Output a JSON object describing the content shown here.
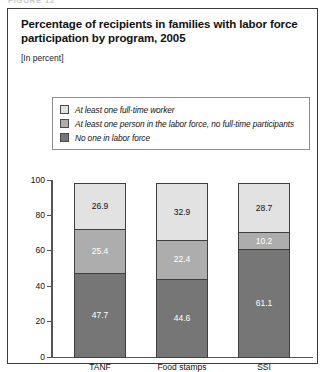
{
  "figure": {
    "caption": "FIGURE 12"
  },
  "header": {
    "title": "Percentage of recipients in families with labor force participation by program, 2005",
    "units_note": "[In percent]"
  },
  "legend": {
    "items": [
      {
        "label": "At least one full-time worker",
        "color": "#e2e2e2",
        "key": "full_time"
      },
      {
        "label": "At least one person in the labor force, no full-time participants",
        "color": "#adadad",
        "key": "partial"
      },
      {
        "label": "No one in labor force",
        "color": "#767676",
        "key": "none"
      }
    ]
  },
  "chart_data": {
    "type": "bar",
    "subtype": "stacked-column",
    "title": "Percentage of recipients in families with labor force participation by program, 2005",
    "subtitle": "[In percent]",
    "xlabel": "",
    "ylabel": "",
    "ylim": [
      0,
      100
    ],
    "yticks": [
      0,
      20,
      40,
      60,
      80,
      100
    ],
    "ytick_labels": [
      "0",
      "20",
      "40",
      "60",
      "80",
      "100"
    ],
    "grid": false,
    "legend_position": "above-plot",
    "categories": [
      "TANF",
      "Food stamps",
      "SSI"
    ],
    "series": [
      {
        "name": "At least one full-time worker",
        "color": "#e2e2e2",
        "values": [
          26.9,
          32.9,
          28.7
        ],
        "value_labels": [
          "26.9",
          "32.9",
          "28.7"
        ]
      },
      {
        "name": "At least one person in the labor force, no full-time participants",
        "color": "#adadad",
        "values": [
          25.4,
          22.4,
          10.2
        ],
        "value_labels": [
          "25.4",
          "22.4",
          "10.2"
        ]
      },
      {
        "name": "No one in labor force",
        "color": "#767676",
        "values": [
          47.7,
          44.6,
          61.1
        ],
        "value_labels": [
          "47.7",
          "44.6",
          "61.1"
        ]
      }
    ]
  }
}
